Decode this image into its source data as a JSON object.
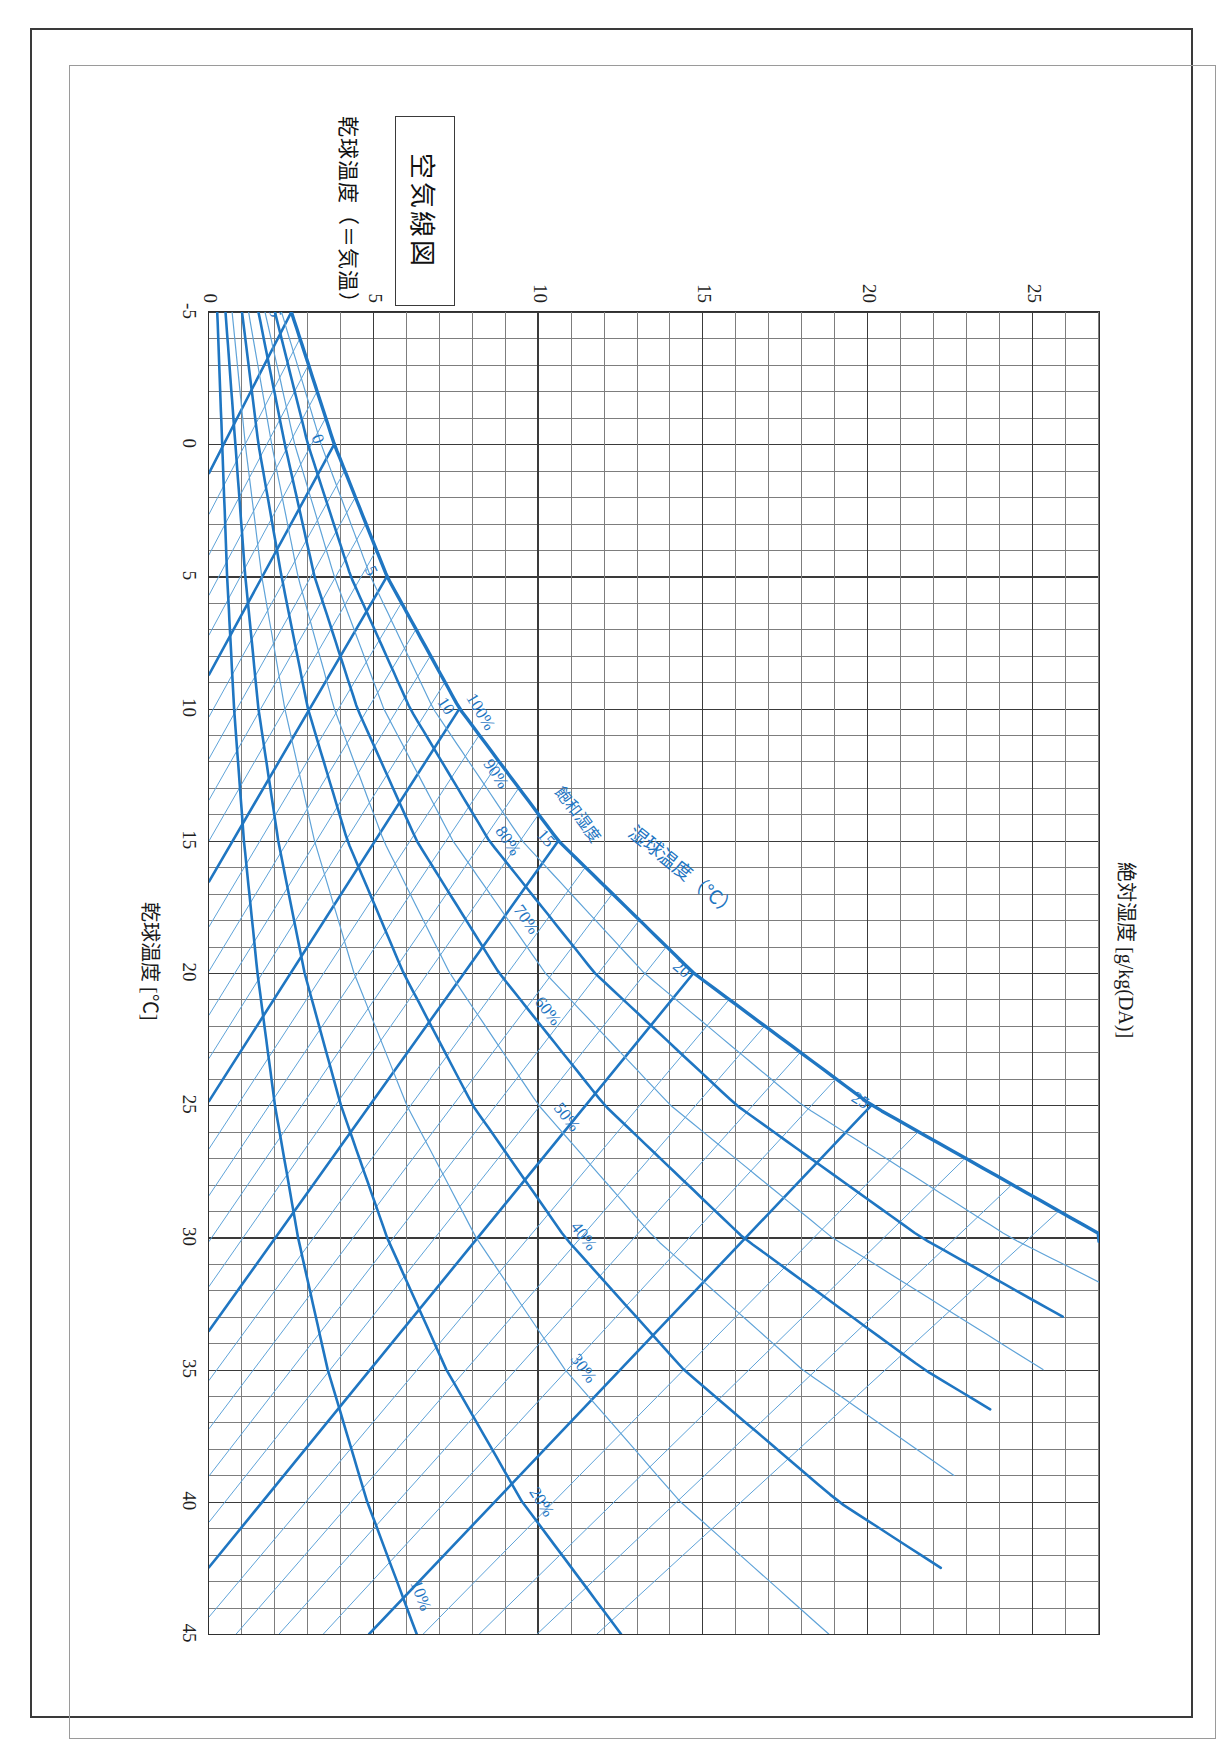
{
  "page": {
    "title_box_label": "空気線図",
    "caption": "乾球温度（＝気温）と湿球温度については p.63 を参照"
  },
  "chart_data": {
    "type": "line",
    "title": "空気線図",
    "xlabel": "乾球温度 [℃]",
    "ylabel": "絶対湿度 [g/kg(DA)]",
    "xlim": [
      -5,
      45
    ],
    "ylim": [
      0,
      27
    ],
    "xticks": [
      -5,
      0,
      5,
      10,
      15,
      20,
      25,
      30,
      35,
      40,
      45
    ],
    "yticks": [
      0,
      5,
      10,
      15,
      20,
      25
    ],
    "xtick_labels": [
      "-5",
      "0",
      "5",
      "10",
      "15",
      "20",
      "25",
      "30",
      "35",
      "40",
      "45"
    ],
    "ytick_labels": [
      "0",
      "5",
      "10",
      "15",
      "20",
      "25"
    ],
    "grid": true,
    "minor_grid": true,
    "x_minor_step": 1,
    "y_minor_step": 1,
    "legend": "none",
    "series": [
      {
        "name": "相対湿度 100%（飽和線）",
        "label": "100%",
        "rh": 100,
        "kind": "relative-humidity",
        "emphasis": "heavy",
        "x": [
          -5,
          0,
          5,
          10,
          15,
          20,
          25,
          30,
          31,
          32
        ],
        "y": [
          2.5,
          3.8,
          5.4,
          7.6,
          10.6,
          14.7,
          20.1,
          27.2,
          28.9,
          30.7
        ]
      },
      {
        "name": "相対湿度 90%",
        "label": "90%",
        "rh": 90,
        "kind": "relative-humidity",
        "emphasis": "light",
        "x": [
          -5,
          0,
          5,
          10,
          15,
          20,
          25,
          30,
          32
        ],
        "y": [
          2.2,
          3.4,
          4.9,
          6.8,
          9.5,
          13.2,
          18.0,
          24.3,
          27.5
        ]
      },
      {
        "name": "相対湿度 80%",
        "label": "80%",
        "rh": 80,
        "kind": "relative-humidity",
        "emphasis": "heavy",
        "x": [
          -5,
          0,
          5,
          10,
          15,
          20,
          25,
          30,
          33
        ],
        "y": [
          2.0,
          3.0,
          4.3,
          6.1,
          8.5,
          11.7,
          16.0,
          21.6,
          25.9
        ]
      },
      {
        "name": "相対湿度 70%",
        "label": "70%",
        "rh": 70,
        "kind": "relative-humidity",
        "emphasis": "light",
        "x": [
          -5,
          0,
          5,
          10,
          15,
          20,
          25,
          30,
          35
        ],
        "y": [
          1.7,
          2.6,
          3.8,
          5.3,
          7.4,
          10.2,
          14.0,
          18.9,
          25.3
        ]
      },
      {
        "name": "相対湿度 60%",
        "label": "60%",
        "rh": 60,
        "kind": "relative-humidity",
        "emphasis": "heavy",
        "x": [
          -5,
          0,
          5,
          10,
          15,
          20,
          25,
          30,
          35,
          36.5
        ],
        "y": [
          1.5,
          2.3,
          3.2,
          4.5,
          6.3,
          8.8,
          12.0,
          16.2,
          21.7,
          23.7
        ]
      },
      {
        "name": "相対湿度 50%",
        "label": "50%",
        "rh": 50,
        "kind": "relative-humidity",
        "emphasis": "light",
        "x": [
          -5,
          0,
          5,
          10,
          15,
          20,
          25,
          30,
          35,
          39
        ],
        "y": [
          1.2,
          1.9,
          2.7,
          3.8,
          5.3,
          7.3,
          10.0,
          13.5,
          18.0,
          22.6
        ]
      },
      {
        "name": "相対湿度 40%",
        "label": "40%",
        "rh": 40,
        "kind": "relative-humidity",
        "emphasis": "heavy",
        "x": [
          -5,
          0,
          5,
          10,
          15,
          20,
          25,
          30,
          35,
          40,
          42.5
        ],
        "y": [
          1.0,
          1.5,
          2.2,
          3.0,
          4.2,
          5.9,
          8.0,
          10.8,
          14.4,
          19.1,
          22.2
        ]
      },
      {
        "name": "相対湿度 30%",
        "label": "30%",
        "rh": 30,
        "kind": "relative-humidity",
        "emphasis": "light",
        "x": [
          -5,
          0,
          5,
          10,
          15,
          20,
          25,
          30,
          35,
          40,
          45
        ],
        "y": [
          0.7,
          1.1,
          1.6,
          2.3,
          3.2,
          4.4,
          6.0,
          8.1,
          10.8,
          14.3,
          18.8
        ]
      },
      {
        "name": "相対湿度 20%",
        "label": "20%",
        "rh": 20,
        "kind": "relative-humidity",
        "emphasis": "heavy",
        "x": [
          -5,
          0,
          5,
          10,
          15,
          20,
          25,
          30,
          35,
          40,
          45
        ],
        "y": [
          0.5,
          0.8,
          1.1,
          1.5,
          2.1,
          2.9,
          4.0,
          5.4,
          7.2,
          9.5,
          12.5
        ]
      },
      {
        "name": "相対湿度 10%",
        "label": "10%",
        "rh": 10,
        "kind": "relative-humidity",
        "emphasis": "heavy",
        "x": [
          -5,
          0,
          5,
          10,
          15,
          20,
          25,
          30,
          35,
          40,
          45
        ],
        "y": [
          0.25,
          0.4,
          0.55,
          0.76,
          1.06,
          1.47,
          2.0,
          2.7,
          3.6,
          4.8,
          6.3
        ]
      }
    ],
    "wet_bulb_lines": {
      "axis_title": "湿球温度（℃）",
      "name": "湿球温度",
      "labels": [
        "-5",
        "0",
        "5",
        "10",
        "15",
        "20",
        "25",
        "30"
      ],
      "values": [
        -5,
        0,
        5,
        10,
        15,
        20,
        25,
        30
      ],
      "step": 1,
      "kind": "wet-bulb"
    },
    "saturation_label": "飽和湿度",
    "annotations": [
      {
        "text": "100%",
        "kind": "rh-label"
      },
      {
        "text": "90%",
        "kind": "rh-label"
      },
      {
        "text": "80%",
        "kind": "rh-label"
      },
      {
        "text": "70%",
        "kind": "rh-label"
      },
      {
        "text": "60%",
        "kind": "rh-label"
      },
      {
        "text": "50%",
        "kind": "rh-label"
      },
      {
        "text": "40%",
        "kind": "rh-label"
      },
      {
        "text": "30%",
        "kind": "rh-label"
      },
      {
        "text": "20%",
        "kind": "rh-label"
      },
      {
        "text": "10%",
        "kind": "rh-label"
      },
      {
        "text": "飽和湿度",
        "kind": "saturation-label"
      },
      {
        "text": "湿球温度（℃）",
        "kind": "wetbulb-axis-label"
      }
    ],
    "colors": {
      "curve": "#1f76c2",
      "curve_light": "#5fa3d8",
      "grid_major": "#3a3a3a",
      "grid_minor": "#7d7d7d",
      "text": "#1a1a1a",
      "frame": "#3a3a3a"
    }
  }
}
